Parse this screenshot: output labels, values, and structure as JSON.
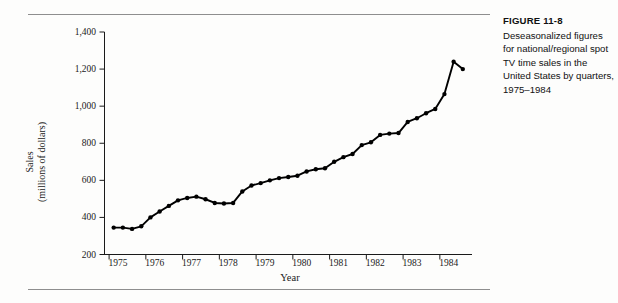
{
  "figure": {
    "caption_title": "FIGURE 11-8",
    "caption_body": "Deseasonalized figures for national/regional spot TV time sales in the United States by quarters, 1975–1984",
    "rule_color": "#8e8e8e",
    "line_color": "#000000",
    "background": "#fdfdfc"
  },
  "chart_data": {
    "type": "line",
    "title": "",
    "subtitle": "",
    "xlabel": "Year",
    "ylabel": "Sales (millions of dollars)",
    "ylabel_line1": "Sales",
    "ylabel_line2": "(millions of dollars)",
    "xlim": [
      1974.75,
      1984.75
    ],
    "ylim": [
      200,
      1400
    ],
    "ytick_values": [
      200,
      400,
      600,
      800,
      1000,
      1200,
      1400
    ],
    "ytick_labels": [
      "200",
      "400",
      "600",
      "800",
      "1,000",
      "1,200",
      "1,400"
    ],
    "xtick_values": [
      1975,
      1976,
      1977,
      1978,
      1979,
      1980,
      1981,
      1982,
      1983,
      1984
    ],
    "xtick_labels": [
      "1975",
      "1976",
      "1977",
      "1978",
      "1979",
      "1980",
      "1981",
      "1982",
      "1983",
      "1984"
    ],
    "grid": false,
    "legend": false,
    "legend_position": "none",
    "marker": "circle",
    "series": [
      {
        "name": "Deseasonalized spot TV time sales",
        "x": [
          1975.0,
          1975.25,
          1975.5,
          1975.75,
          1976.0,
          1976.25,
          1976.5,
          1976.75,
          1977.0,
          1977.25,
          1977.5,
          1977.75,
          1978.0,
          1978.25,
          1978.5,
          1978.75,
          1979.0,
          1979.25,
          1979.5,
          1979.75,
          1980.0,
          1980.25,
          1980.5,
          1980.75,
          1981.0,
          1981.25,
          1981.5,
          1981.75,
          1982.0,
          1982.25,
          1982.5,
          1982.75,
          1983.0,
          1983.25,
          1983.5,
          1983.75,
          1984.0,
          1984.25,
          1984.5
        ],
        "values": [
          345,
          345,
          338,
          352,
          400,
          432,
          462,
          492,
          505,
          512,
          498,
          478,
          475,
          478,
          540,
          572,
          585,
          600,
          612,
          618,
          625,
          648,
          660,
          665,
          700,
          725,
          742,
          790,
          805,
          845,
          852,
          855,
          915,
          935,
          962,
          985,
          1065,
          1240,
          1200
        ]
      }
    ]
  }
}
